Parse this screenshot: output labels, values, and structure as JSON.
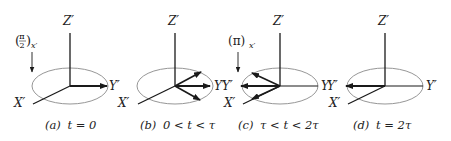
{
  "figure": {
    "type": "rotating-frame-magnetization-diagram",
    "colors": {
      "axis": "#1a1a1a",
      "ellipse": "#8a8a8a",
      "text": "#222222",
      "background": "#ffffff"
    },
    "panels": [
      {
        "id": "a",
        "caption": "(a) t = 0",
        "caption_prefix": "(a)",
        "caption_cond": "t = 0",
        "axis_labels": {
          "z": "Z′",
          "y": "Y′",
          "x": "X′"
        },
        "pulse_label": {
          "base": "(π/2)",
          "num": "π",
          "den": "2",
          "sub": "x′"
        },
        "vectors": [
          "+Y′"
        ]
      },
      {
        "id": "b",
        "caption": "(b) 0 < t < τ",
        "caption_prefix": "(b)",
        "caption_cond": "0 < t < τ",
        "axis_labels": {
          "z": "Z′",
          "y": "Y′",
          "x": "X′",
          "y_neg": "−Y′"
        },
        "vectors": [
          "fanning toward +Y′ (upper)",
          "+Y′",
          "fanning toward +Y′ (lower)"
        ]
      },
      {
        "id": "c",
        "caption": "(c) τ < t < 2τ",
        "caption_prefix": "(c)",
        "caption_cond": "τ < t < 2τ",
        "axis_labels": {
          "z": "Z′",
          "y": "Y′",
          "x": "X′",
          "y_neg": "Y′"
        },
        "pulse_label": {
          "base": "(π)",
          "sub": "x′"
        },
        "vectors": [
          "refocusing toward −Y′ (upper)",
          "−Y′",
          "refocusing toward −Y′ (lower)"
        ]
      },
      {
        "id": "d",
        "caption": "(d) t = 2τ",
        "caption_prefix": "(d)",
        "caption_cond": "t = 2τ",
        "axis_labels": {
          "z": "Z′",
          "y": "Y′",
          "x": "X′",
          "y_neg": "Y′"
        },
        "vectors": [
          "−Y′ (echo)"
        ]
      }
    ]
  }
}
